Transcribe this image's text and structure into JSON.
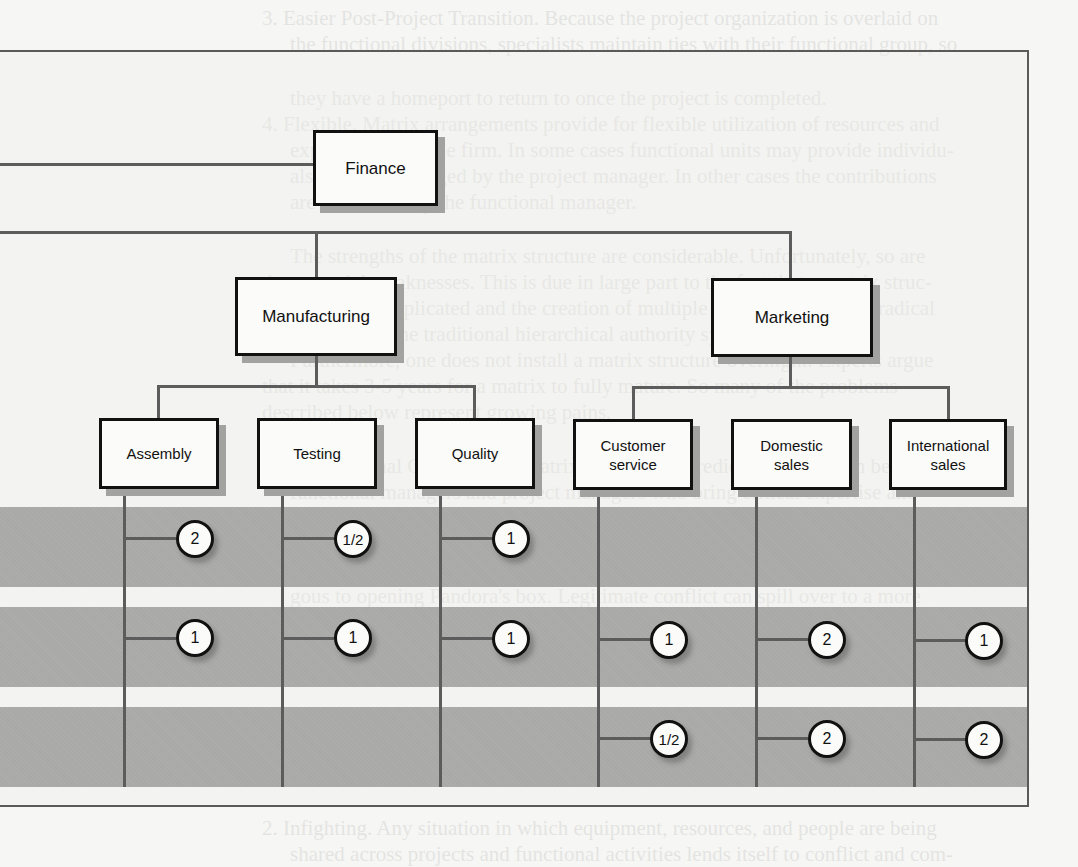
{
  "diagram": {
    "type": "matrix-organization-chart",
    "top_unit": {
      "label": "Finance"
    },
    "divisions": [
      {
        "label": "Manufacturing",
        "units": [
          "Assembly",
          "Testing",
          "Quality"
        ]
      },
      {
        "label": "Marketing",
        "units": [
          "Customer\nservice",
          "Domestic\nsales",
          "International\nsales"
        ]
      }
    ],
    "units": [
      {
        "label": "Assembly",
        "allocations": [
          "2",
          "1",
          ""
        ]
      },
      {
        "label": "Testing",
        "allocations": [
          "1/2",
          "1",
          ""
        ]
      },
      {
        "label": "Quality",
        "allocations": [
          "1",
          "1",
          ""
        ]
      },
      {
        "label": "Customer\nservice",
        "allocations": [
          "",
          "1",
          "1/2"
        ]
      },
      {
        "label": "Domestic\nsales",
        "allocations": [
          "",
          "2",
          "2"
        ]
      },
      {
        "label": "International\nsales",
        "allocations": [
          "",
          "1",
          "2"
        ]
      }
    ],
    "project_rows": 3
  },
  "bleed_through_text": [
    "3. Easier Post-Project Transition. Because the project organization is overlaid on",
    "the functional divisions, specialists maintain ties with their functional group, so",
    "they have a homeport to return to once the project is completed.",
    "4. Flexible. Matrix arrangements provide for flexible utilization of resources and",
    "expertise within the firm. In some cases functional units may provide individu-",
    "als who are managed by the project manager. In other cases the contributions",
    "are monitored by the functional manager.",
    "The strengths of the matrix structure are considerable. Unfortunately, so are",
    "the potential weaknesses. This is due in large part to the fact that a matrix struc-",
    "ture is more complicated and the creation of multiple bosses represents a radical",
    "departure from the traditional hierarchical authority system.",
    "Furthermore, one does not install a matrix structure overnight. Experts argue",
    "that it takes 3-5 years for a matrix to fully mature. So many of the problems",
    "described below represent growing pains.",
    "1. Dysfunctional Conflict. The matrix approach is predicated on tension between",
    "functional managers and project managers who bring critical expertise and",
    "perspectives to the project. Such tension is viewed as a necessary mechanism for",
    "achieving an appropriate balance between complex technical issues and unique",
    "project requirements. While the intent is noble, the effect is sometimes analo-",
    "gous to opening Pandora's box. Legitimate conflict can spill over to a more",
    "personal level, resulting from conflicting agendas and accountabilities. Worthy",
    "discussions can degenerate into heated arguments that engender animosity",
    "among the managers involved.",
    "2. Infighting. Any situation in which equipment, resources, and people are being",
    "shared across projects and functional activities lends itself to conflict and com-"
  ]
}
